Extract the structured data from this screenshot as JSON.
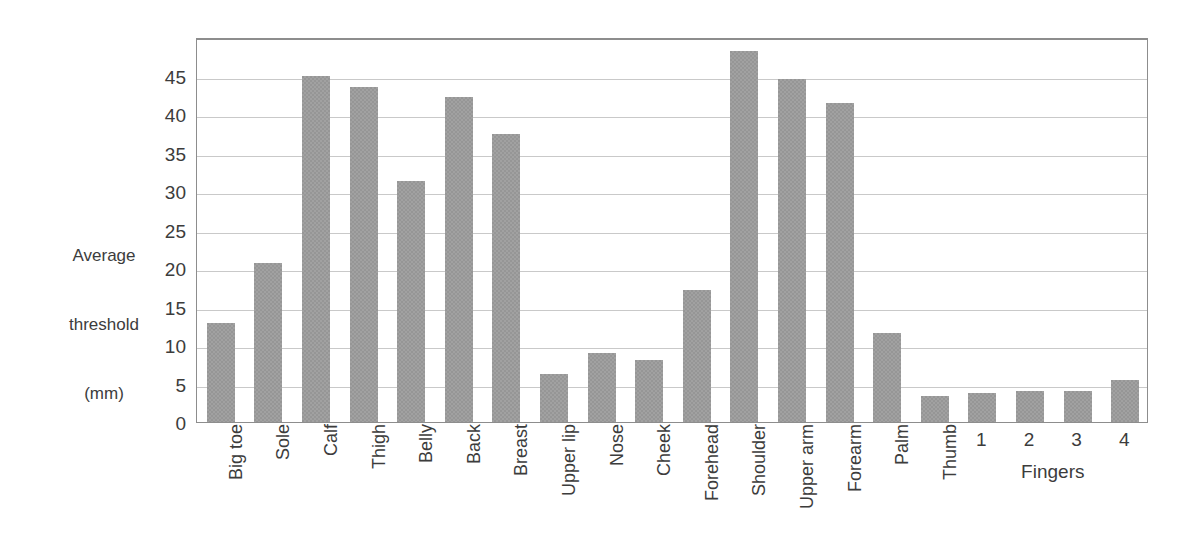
{
  "chart_data": {
    "type": "bar",
    "title": "",
    "subtitle": "",
    "xlabel": "",
    "ylabel": "Average\nthreshold\n(mm)",
    "ylabel_lines": [
      "Average",
      "threshold",
      "(mm)"
    ],
    "ylim": [
      0,
      50
    ],
    "yticks": [
      0,
      5,
      10,
      15,
      20,
      25,
      30,
      35,
      40,
      45
    ],
    "ytick_labels": [
      "0",
      "5",
      "10",
      "15",
      "20",
      "25",
      "30",
      "35",
      "40",
      "45"
    ],
    "grid": true,
    "grid_axis": "y",
    "legend": false,
    "legend_position": "none",
    "bar_color": "#969696",
    "categories": [
      "Big toe",
      "Sole",
      "Calf",
      "Thigh",
      "Belly",
      "Back",
      "Breast",
      "Upper lip",
      "Nose",
      "Cheek",
      "Forehead",
      "Shoulder",
      "Upper arm",
      "Forearm",
      "Palm",
      "Thumb",
      "1",
      "2",
      "3",
      "4"
    ],
    "values": [
      12.8,
      20.7,
      45.0,
      43.5,
      31.3,
      42.2,
      37.4,
      6.2,
      9.0,
      8.1,
      17.1,
      48.2,
      44.6,
      41.4,
      11.5,
      3.4,
      3.8,
      4.0,
      4.0,
      5.5
    ],
    "label_orientation": [
      "vertical",
      "vertical",
      "vertical",
      "vertical",
      "vertical",
      "vertical",
      "vertical",
      "vertical",
      "vertical",
      "vertical",
      "vertical",
      "vertical",
      "vertical",
      "vertical",
      "vertical",
      "vertical",
      "horizontal",
      "horizontal",
      "horizontal",
      "horizontal"
    ],
    "group_annotations": [
      {
        "label": "Fingers",
        "categories": [
          "1",
          "2",
          "3",
          "4"
        ]
      }
    ]
  },
  "colors": {
    "bar": "#969696",
    "gridline": "#c9c9c9",
    "axis_frame": "#8d8d8d",
    "text": "#3c3c3c",
    "background": "#ffffff"
  }
}
